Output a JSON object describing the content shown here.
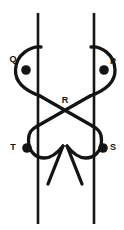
{
  "figure": {
    "type": "line-diagram",
    "title": "",
    "background_color": "#ffffff",
    "stroke_color": "#141414",
    "node_color": "#141414",
    "width": 124,
    "height": 230
  },
  "labels": {
    "q": "Q",
    "p": "P",
    "r": "R",
    "t": "T",
    "s": "S"
  },
  "nodes": [
    {
      "id": "Q",
      "label": "Q",
      "x": 26,
      "y": 70,
      "radius": 4.6,
      "filled": true,
      "label_x": 14,
      "label_y": 59
    },
    {
      "id": "P",
      "label": "P",
      "x": 104,
      "y": 70,
      "radius": 4.6,
      "filled": true,
      "label_x": 112,
      "label_y": 62
    },
    {
      "id": "R",
      "label": "R",
      "x": 65,
      "y": 104,
      "radius": 0,
      "filled": false,
      "label_x": 62,
      "label_y": 101
    },
    {
      "id": "T",
      "label": "T",
      "x": 27,
      "y": 148,
      "radius": 4.6,
      "filled": true,
      "label_x": 13,
      "label_y": 145
    },
    {
      "id": "S",
      "label": "S",
      "x": 103,
      "y": 148,
      "radius": 4.6,
      "filled": true,
      "label_x": 111,
      "label_y": 145
    }
  ],
  "vertical_lines": [
    {
      "id": "left-vertical",
      "x": 38,
      "y1": 13,
      "y2": 224,
      "width": 2.4
    },
    {
      "id": "right-vertical",
      "x": 94,
      "y1": 13,
      "y2": 224,
      "width": 2.4
    }
  ],
  "curves": [
    {
      "id": "left-strand",
      "description": "S-shaped strand passing through Q and T, crossing at R",
      "path": "M 40 48 C 30 48 16 56 16 70 C 16 84 28 92 40 96 L 92 126 C 96 128 100 134 100 139"
    },
    {
      "id": "right-strand",
      "description": "S-shaped strand passing through P and S, crossing at R",
      "path": "M 92 48 C 102 48 114 56 114 70 C 114 84 102 92 90 96 L 38 126 C 34 128 30 134 30 139"
    }
  ],
  "stroke_width": 3.2
}
